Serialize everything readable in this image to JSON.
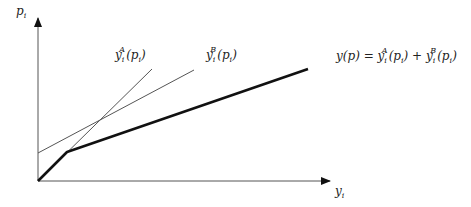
{
  "axes": {
    "y_label": "p",
    "y_label_sub": "i",
    "x_label": "y",
    "x_label_sub": "i"
  },
  "curves": {
    "a": {
      "name": "y",
      "sub": "i",
      "sup": "A",
      "arg": "(p",
      "arg_sub": "i",
      "close": ")"
    },
    "b": {
      "name": "y",
      "sub": "i",
      "sup": "B",
      "arg": "(p",
      "arg_sub": "i",
      "close": ")"
    },
    "sum": {
      "lhs": "y(p) = ",
      "t1_name": "y",
      "t1_sub": "i",
      "t1_sup": "A",
      "t1_arg": "(p",
      "t1_arg_sub": "i",
      "t1_close": ")",
      "plus": " + ",
      "t2_name": "y",
      "t2_sub": "i",
      "t2_sup": "B",
      "t2_arg": "(p",
      "t2_arg_sub": "i",
      "t2_close": ")"
    }
  },
  "colors": {
    "axis": "#333333",
    "thin": "#444444",
    "thick": "#111111"
  }
}
